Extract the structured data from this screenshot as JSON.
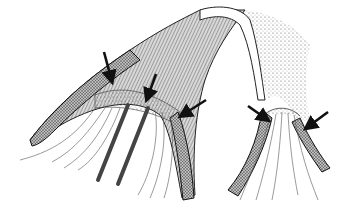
{
  "figure": {
    "type": "scientific-illustration",
    "style": "black-and-white stippled pen drawing",
    "colors": {
      "background": "#ffffff",
      "ink": "#111111",
      "stipple": "#555555",
      "dark_band": "#3a3a3a"
    },
    "left_structure": {
      "arrows": 3,
      "rods": 2
    },
    "right_structure": {
      "arrows": 2
    },
    "arrows": [
      {
        "id": "arrow-1",
        "tip": [
          112,
          82
        ],
        "tail": [
          104,
          52
        ]
      },
      {
        "id": "arrow-2",
        "tip": [
          146,
          100
        ],
        "tail": [
          156,
          74
        ]
      },
      {
        "id": "arrow-3",
        "tip": [
          180,
          116
        ],
        "tail": [
          206,
          100
        ]
      },
      {
        "id": "arrow-4",
        "tip": [
          268,
          120
        ],
        "tail": [
          248,
          106
        ]
      },
      {
        "id": "arrow-5",
        "tip": [
          306,
          128
        ],
        "tail": [
          328,
          112
        ]
      }
    ]
  }
}
